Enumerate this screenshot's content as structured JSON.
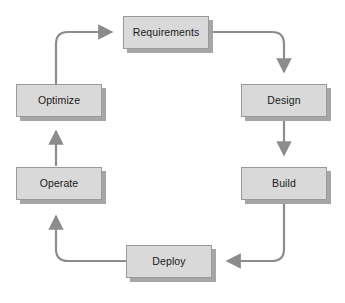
{
  "diagram": {
    "type": "cycle-flow-diagram",
    "background_color": "#ffffff",
    "node_fill_color": "#d9d9d9",
    "node_border_color": "#9a9a9a",
    "node_shadow_color": "#a6a6a6",
    "connector_color": "#8c8c8c",
    "label_color": "#1a1a1a",
    "nodes": [
      {
        "id": "requirements",
        "label": "Requirements",
        "x": 123,
        "y": 16,
        "width": 86,
        "height": 33
      },
      {
        "id": "design",
        "label": "Design",
        "x": 241,
        "y": 84,
        "width": 86,
        "height": 33
      },
      {
        "id": "build",
        "label": "Build",
        "x": 241,
        "y": 167,
        "width": 86,
        "height": 33
      },
      {
        "id": "deploy",
        "label": "Deploy",
        "x": 126,
        "y": 245,
        "width": 86,
        "height": 33
      },
      {
        "id": "operate",
        "label": "Operate",
        "x": 16,
        "y": 167,
        "width": 86,
        "height": 33
      },
      {
        "id": "optimize",
        "label": "Optimize",
        "x": 16,
        "y": 84,
        "width": 86,
        "height": 33
      }
    ],
    "connectors": [
      {
        "id": "optimize-to-requirements",
        "from": "optimize",
        "to": "requirements",
        "shape": "curve",
        "arrow_direction": "right"
      },
      {
        "id": "requirements-to-design",
        "from": "requirements",
        "to": "design",
        "shape": "curve",
        "arrow_direction": "down"
      },
      {
        "id": "design-to-build",
        "from": "design",
        "to": "build",
        "shape": "straight",
        "arrow_direction": "down"
      },
      {
        "id": "build-to-deploy",
        "from": "build",
        "to": "deploy",
        "shape": "curve",
        "arrow_direction": "left"
      },
      {
        "id": "deploy-to-operate",
        "from": "deploy",
        "to": "operate",
        "shape": "curve",
        "arrow_direction": "up"
      },
      {
        "id": "operate-to-optimize",
        "from": "operate",
        "to": "optimize",
        "shape": "straight",
        "arrow_direction": "up"
      }
    ]
  }
}
